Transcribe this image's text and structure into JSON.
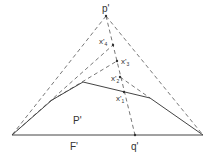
{
  "diagram": {
    "labels": {
      "apex": "p'",
      "x1": "x'",
      "x1_sub": "1",
      "x2": "x'",
      "x2_sub": "2",
      "x3": "x'",
      "x3_sub": "3",
      "x4": "x'",
      "x4_sub": "4",
      "polygon": "P'",
      "base": "F'",
      "q": "q'"
    },
    "colors": {
      "stroke": "#444444",
      "text": "#333333",
      "background": "#ffffff"
    }
  }
}
